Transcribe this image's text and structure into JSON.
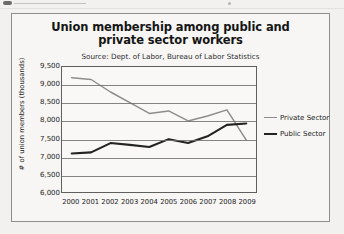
{
  "chart_data": {
    "type": "line",
    "title": "Union membership among public and private sector workers",
    "subtitle": "Source: Dept. of Labor, Bureau of Labor Statistics",
    "xlabel": "",
    "ylabel": "# of union members (thousands)",
    "categories": [
      "2000",
      "2001",
      "2002",
      "2003",
      "2004",
      "2005",
      "2006",
      "2007",
      "2008",
      "2009"
    ],
    "ylim": [
      6000,
      9500
    ],
    "ytick_step": 500,
    "ytick_labels": [
      "9,500",
      "9,000",
      "8,500",
      "8,000",
      "7,500",
      "7,000",
      "6,500",
      "6,000"
    ],
    "grid": true,
    "legend_position": "right",
    "series": [
      {
        "name": "Private Sector",
        "color": "#8d8d8b",
        "values": [
          9200,
          9150,
          8800,
          8500,
          8200,
          8270,
          7990,
          8130,
          8300,
          7450
        ]
      },
      {
        "name": "Public Sector",
        "color": "#232323",
        "values": [
          7080,
          7110,
          7370,
          7320,
          7260,
          7480,
          7370,
          7560,
          7880,
          7920
        ]
      }
    ]
  },
  "legend": {
    "items": [
      {
        "label": "Private Sector"
      },
      {
        "label": "Public Sector"
      }
    ]
  }
}
